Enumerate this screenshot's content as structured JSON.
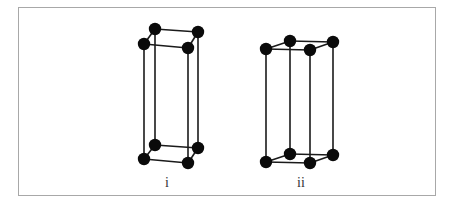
{
  "figure": {
    "frame": {
      "x": 18,
      "y": 7,
      "w": 418,
      "h": 189,
      "border_color": "#a8a8a8"
    },
    "atom_color": "#0a0a0a",
    "bond_color": "#1a1a1a",
    "structures": [
      {
        "label": "i",
        "label_pos": [
          167,
          186
        ],
        "atoms": [
          [
            155,
            29
          ],
          [
            198,
            32
          ],
          [
            144,
            44
          ],
          [
            188,
            48
          ],
          [
            155,
            145
          ],
          [
            198,
            148
          ],
          [
            144,
            159
          ],
          [
            188,
            163
          ]
        ],
        "bonds": [
          [
            0,
            1
          ],
          [
            1,
            3
          ],
          [
            3,
            2
          ],
          [
            2,
            0
          ],
          [
            4,
            5
          ],
          [
            5,
            7
          ],
          [
            7,
            6
          ],
          [
            6,
            4
          ],
          [
            0,
            4
          ],
          [
            1,
            5
          ],
          [
            2,
            6
          ],
          [
            3,
            7
          ]
        ]
      },
      {
        "label": "ii",
        "label_pos": [
          301,
          186
        ],
        "atoms": [
          [
            266,
            49
          ],
          [
            290,
            41
          ],
          [
            310,
            50
          ],
          [
            333,
            42
          ],
          [
            266,
            162
          ],
          [
            290,
            154
          ],
          [
            310,
            163
          ],
          [
            333,
            155
          ]
        ],
        "bonds": [
          [
            0,
            1
          ],
          [
            1,
            3
          ],
          [
            3,
            2
          ],
          [
            2,
            0
          ],
          [
            4,
            5
          ],
          [
            5,
            7
          ],
          [
            7,
            6
          ],
          [
            6,
            4
          ],
          [
            0,
            4
          ],
          [
            1,
            5
          ],
          [
            2,
            6
          ],
          [
            3,
            7
          ]
        ]
      }
    ]
  }
}
